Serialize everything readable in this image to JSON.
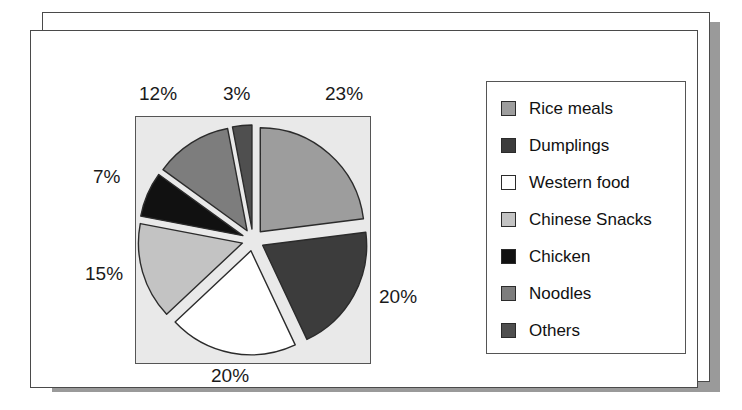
{
  "figure": {
    "name": "exploded-pie-chart-food-categories",
    "background": "#ffffff",
    "card_border_color": "#4a4a4a",
    "shadow_color": "#9a9a9a",
    "plot_background": "#e9e9e9"
  },
  "chart_data": {
    "type": "pie",
    "title": "",
    "subtitle": "",
    "xlabel": "",
    "ylabel": "",
    "exploded": true,
    "start_angle_deg": 0,
    "direction": "clockwise",
    "grid": false,
    "legend_position": "right",
    "categories": [
      "Rice meals",
      "Dumplings",
      "Western food",
      "Chinese Snacks",
      "Chicken",
      "Noodles",
      "Others"
    ],
    "values": [
      23,
      20,
      20,
      15,
      7,
      12,
      3
    ],
    "value_labels": [
      "23%",
      "20%",
      "20%",
      "15%",
      "7%",
      "12%",
      "3%"
    ],
    "colors": [
      "#9d9d9d",
      "#3c3c3c",
      "#ffffff",
      "#c3c3c3",
      "#111111",
      "#7d7d7d",
      "#4f4f4f"
    ],
    "slice_border_color": "#2b2b2b",
    "slices": [
      {
        "label": "Rice meals",
        "value": 23,
        "value_label": "23%",
        "color": "#9d9d9d"
      },
      {
        "label": "Dumplings",
        "value": 20,
        "value_label": "20%",
        "color": "#3c3c3c"
      },
      {
        "label": "Western food",
        "value": 20,
        "value_label": "20%",
        "color": "#ffffff"
      },
      {
        "label": "Chinese Snacks",
        "value": 15,
        "value_label": "15%",
        "color": "#c3c3c3"
      },
      {
        "label": "Chicken",
        "value": 7,
        "value_label": "7%",
        "color": "#111111"
      },
      {
        "label": "Noodles",
        "value": 12,
        "value_label": "12%",
        "color": "#7d7d7d"
      },
      {
        "label": "Others",
        "value": 3,
        "value_label": "3%",
        "color": "#4f4f4f"
      }
    ]
  },
  "labels": {
    "rice": "23%",
    "dumplings": "20%",
    "western": "20%",
    "snacks": "15%",
    "chicken": "7%",
    "noodles": "12%",
    "others": "3%"
  },
  "legend": {
    "items": [
      {
        "label": "Rice meals",
        "color": "#9d9d9d"
      },
      {
        "label": "Dumplings",
        "color": "#3c3c3c"
      },
      {
        "label": "Western food",
        "color": "#ffffff"
      },
      {
        "label": "Chinese Snacks",
        "color": "#c3c3c3"
      },
      {
        "label": "Chicken",
        "color": "#111111"
      },
      {
        "label": "Noodles",
        "color": "#7d7d7d"
      },
      {
        "label": "Others",
        "color": "#4f4f4f"
      }
    ]
  }
}
